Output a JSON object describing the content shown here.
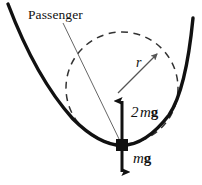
{
  "figure": {
    "kind": "physics-free-body-diagram",
    "background_color": "#ffffff",
    "stroke_color": "#111111"
  },
  "labels": {
    "passenger": "Passenger",
    "radius": "r",
    "normal_force_coefficient": "2",
    "normal_force_mass": "m",
    "normal_force_gravity": "g",
    "normal_force_full": "2 mg",
    "weight_mass": "m",
    "weight_gravity": "g",
    "weight_full": "mg"
  },
  "geometry": {
    "track": {
      "type": "parabola-valley",
      "left_end": {
        "x": 8,
        "y": 4
      },
      "vertex": {
        "x": 122,
        "y": 145
      },
      "right_end": {
        "x": 193,
        "y": 18
      },
      "stroke_width": 3.2
    },
    "radius_circle": {
      "type": "dashed-circle",
      "center": {
        "x": 122,
        "y": 88
      },
      "radius": 56,
      "dash": "6 5",
      "stroke_width": 1.4
    },
    "radius_arrow": {
      "from": {
        "x": 119,
        "y": 92
      },
      "to": {
        "x": 160,
        "y": 51
      },
      "stroke_width": 1.2
    },
    "passenger_block": {
      "x": 117,
      "y": 140,
      "width": 11,
      "height": 11,
      "fill": "#111111"
    },
    "passenger_leader": {
      "from": {
        "x": 62,
        "y": 22
      },
      "to": {
        "x": 120,
        "y": 140
      },
      "stroke_width": 1.0
    },
    "normal_force_arrow": {
      "from": {
        "x": 122,
        "y": 145
      },
      "to": {
        "x": 122,
        "y": 93
      },
      "direction": "up",
      "stroke_width": 3.0
    },
    "weight_arrow": {
      "from": {
        "x": 122,
        "y": 146
      },
      "to": {
        "x": 122,
        "y": 180
      },
      "direction": "down",
      "stroke_width": 3.0
    }
  },
  "colors": {
    "ink": "#111111",
    "paper": "#ffffff"
  }
}
